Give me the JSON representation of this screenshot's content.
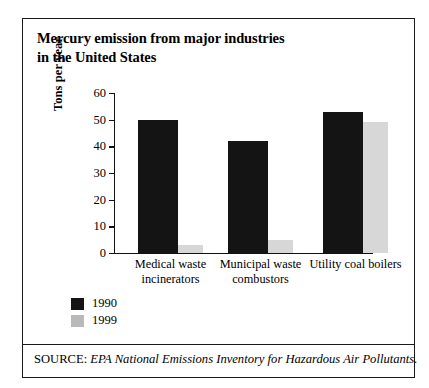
{
  "figure": {
    "title_line1": "Mercury emission from major industries",
    "title_line2": "in the United States",
    "source_prefix": "SOURCE:",
    "source_text": "EPA National Emissions Inventory for Hazardous Air Pollutants."
  },
  "chart_data": {
    "type": "bar",
    "title": "Mercury emission from major industries in the United States",
    "xlabel": "",
    "ylabel": "Tons per year",
    "ylim": [
      0,
      60
    ],
    "yticks": [
      0,
      10,
      20,
      30,
      40,
      50,
      60
    ],
    "ytick_labels": [
      "0",
      "10",
      "20",
      "30",
      "40",
      "50",
      "60"
    ],
    "grid": false,
    "legend_position": "below-left",
    "categories": [
      "Medical waste incinerators",
      "Municipal waste combustors",
      "Utility coal boilers"
    ],
    "category_lines": [
      [
        "Medical waste",
        "incinerators"
      ],
      [
        "Municipal waste",
        "combustors"
      ],
      [
        "Utility coal boilers",
        ""
      ]
    ],
    "series": [
      {
        "name": "1990",
        "color": "#141414",
        "values": [
          50,
          42,
          53
        ]
      },
      {
        "name": "1999",
        "color": "#d7d7d7",
        "values": [
          3,
          5,
          49
        ]
      }
    ]
  },
  "legend": {
    "items": [
      {
        "label": "1990",
        "color": "#141414"
      },
      {
        "label": "1999",
        "color": "#b9b9b9"
      }
    ]
  }
}
